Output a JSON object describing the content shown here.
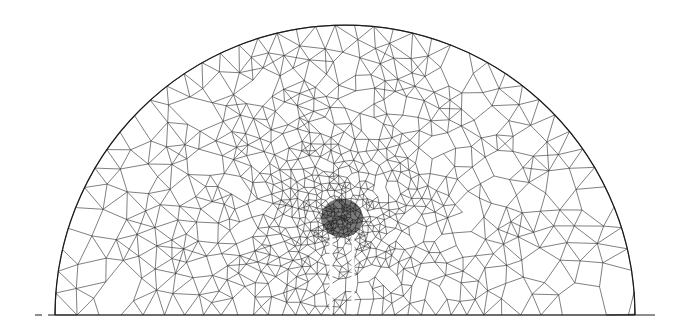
{
  "diagram": {
    "type": "finite-element-triangular-mesh",
    "domain_shape": "semicircle",
    "canvas": {
      "width": 687,
      "height": 334
    },
    "colors": {
      "background": "#ffffff",
      "mesh_line": "#2a2a2a",
      "boundary": "#1a1a1a",
      "slot": "#ffffff",
      "dense_core": "#0d0d0d"
    },
    "semicircle": {
      "cx": 345,
      "cy": 315,
      "r": 290
    },
    "baseline": {
      "x1": 35,
      "x2": 655,
      "y": 315,
      "dash_left": [
        35,
        48
      ]
    },
    "refinement_center": {
      "x": 342,
      "y": 218,
      "radius": 28
    },
    "slots": [
      {
        "x": 331,
        "y_top": 235,
        "y_bottom": 315,
        "width": 3
      },
      {
        "x": 353,
        "y_top": 235,
        "y_bottom": 315,
        "width": 3
      }
    ],
    "coarse_element_size": 22,
    "fine_element_size": 3
  }
}
